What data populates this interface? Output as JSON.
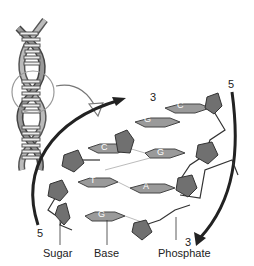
{
  "diagram": {
    "title": "",
    "strand_ends": {
      "top_left": "3",
      "top_right": "5",
      "bottom_left": "5",
      "bottom_right": "3"
    },
    "base_pairs": [
      {
        "left": "G",
        "right": "C"
      },
      {
        "left": "C",
        "right": "G"
      },
      {
        "left": "T",
        "right": "A"
      },
      {
        "left": "G",
        "right": "C"
      }
    ],
    "base_letters_visible": [
      "C",
      "G",
      "C",
      "G",
      "T",
      "A",
      "G"
    ],
    "labels": {
      "sugar": "Sugar",
      "base": "Base",
      "phosphate": "Phosphate"
    },
    "colors": {
      "sugar_fill": "#707070",
      "base_fill": "#9a9a9a",
      "strand_line": "#333333",
      "arrow": "#222222",
      "highlight_circle": "#999999"
    }
  }
}
